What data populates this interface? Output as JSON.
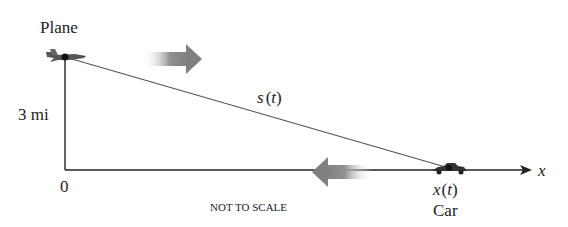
{
  "diagram": {
    "plane_label": "Plane",
    "height_label": "3 mi",
    "origin_label": "0",
    "hypotenuse_label": "s(t)",
    "hyp_s": "s",
    "hyp_open": "(",
    "hyp_t": "t",
    "hyp_close": ")",
    "car_position_x": "x",
    "car_position_open": "(",
    "car_position_t": "t",
    "car_position_close": ")",
    "car_label": "Car",
    "axis_label": "x",
    "scale_note": "NOT TO SCALE"
  },
  "colors": {
    "line": "#555555",
    "axis": "#222222",
    "arrow": "#808080",
    "vehicle": "#333333"
  }
}
